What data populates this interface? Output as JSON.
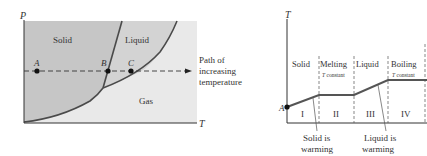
{
  "phase_diagram": {
    "axis_y": "P",
    "axis_x": "T",
    "regions": {
      "solid": "Solid",
      "liquid": "Liquid",
      "gas": "Gas"
    },
    "points": [
      "A",
      "B",
      "C"
    ],
    "path_label": [
      "Path of",
      "increasing",
      "temperature"
    ],
    "colors": {
      "solid_fill": "#c9c9c9",
      "liquid_fill": "#d2d2d2",
      "gas_fill": "#e9e9e9",
      "curve": "#4a4a4a"
    }
  },
  "heating_curve": {
    "axis_y": "T",
    "start_point": "A",
    "segments": [
      {
        "phase": "Solid",
        "numeral": "I",
        "note": ""
      },
      {
        "phase": "Melting",
        "numeral": "II",
        "note": "T constant"
      },
      {
        "phase": "Liquid",
        "numeral": "III",
        "note": ""
      },
      {
        "phase": "Boiling",
        "numeral": "IV",
        "note": "T constant"
      }
    ],
    "callouts": {
      "solid": [
        "Solid is",
        "warming"
      ],
      "liquid": [
        "Liquid is",
        "warming"
      ]
    }
  }
}
